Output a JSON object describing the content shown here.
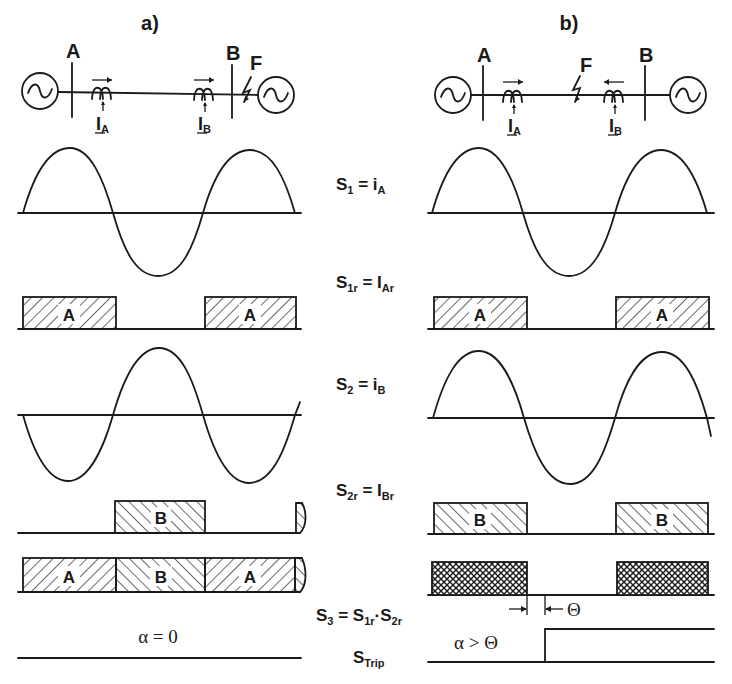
{
  "figure": {
    "panels": [
      {
        "id": "a",
        "title": "a)",
        "network": {
          "bus_left": "A",
          "bus_right": "B",
          "fault": "F",
          "fault_location": "beyond bus B (external fault)",
          "current_left": "I",
          "current_left_sub": "A",
          "current_right": "I",
          "current_right_sub": "B",
          "arrow_left_dir": "right",
          "arrow_right_dir": "right"
        },
        "blocks_s1r": [
          "A",
          "A"
        ],
        "blocks_s2r": [
          "B"
        ],
        "blocks_s3": [
          "A",
          "B",
          "A"
        ],
        "condition": "α = 0"
      },
      {
        "id": "b",
        "title": "b)",
        "network": {
          "bus_left": "A",
          "bus_right": "B",
          "fault": "F",
          "fault_location": "between buses A and B (internal fault)",
          "current_left": "I",
          "current_left_sub": "A",
          "current_right": "I",
          "current_right_sub": "B",
          "arrow_left_dir": "right",
          "arrow_right_dir": "left"
        },
        "blocks_s1r": [
          "A",
          "A"
        ],
        "blocks_s2r": [
          "B",
          "B"
        ],
        "blocks_s3": [
          "",
          ""
        ],
        "theta_label": "Θ",
        "condition": "α > Θ"
      }
    ],
    "signal_labels": {
      "s1": {
        "main": "S",
        "sub": "1",
        "eq": " = i",
        "eq_sub": "A"
      },
      "s1r": {
        "main": "S",
        "sub": "1r",
        "eq": " = I",
        "eq_sub": "Ar"
      },
      "s2": {
        "main": "S",
        "sub": "2",
        "eq": " = i",
        "eq_sub": "B"
      },
      "s2r": {
        "main": "S",
        "sub": "2r",
        "eq": " = I",
        "eq_sub": "Br"
      },
      "s3": {
        "main": "S",
        "sub": "3",
        "eq": " = S",
        "eq_sub": "1r",
        "eq2": "·S",
        "eq2_sub": "2r"
      },
      "strip": {
        "main": "S",
        "sub": "Trip"
      }
    }
  }
}
